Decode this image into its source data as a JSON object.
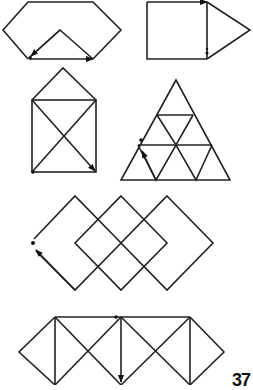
{
  "figures": [
    {
      "id": 1,
      "name": "hexagon-with-v",
      "start": "bottom-left",
      "arrows": [
        "right along base",
        "up-left along V"
      ]
    },
    {
      "id": 2,
      "name": "square-with-triangle",
      "start": "right side of square",
      "arrows": [
        "right along top"
      ]
    },
    {
      "id": 3,
      "name": "house-with-x",
      "start": "bottom-left",
      "arrows": [
        "diagonal down-right"
      ]
    },
    {
      "id": 4,
      "name": "triangle-of-triangles",
      "start": "left edge",
      "arrows": [
        "up-left"
      ]
    },
    {
      "id": 5,
      "name": "overlapping-diamonds",
      "start": "left tip",
      "arrows": [
        "up-left"
      ]
    },
    {
      "id": 6,
      "name": "diamonds-with-verticals",
      "start": "top line",
      "arrows": [
        "down vertical"
      ]
    }
  ],
  "page_number": "37"
}
